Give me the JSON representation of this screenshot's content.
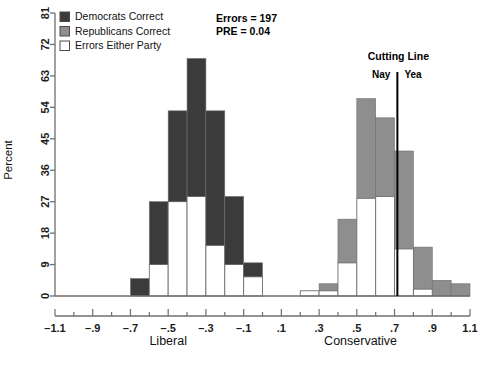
{
  "chart_data": {
    "type": "bar",
    "title": "",
    "xlabel": "",
    "ylabel": "Percent",
    "xlim": [
      -1.1,
      1.1
    ],
    "ylim": [
      0,
      81
    ],
    "grid": false,
    "legend_position": "top-left",
    "x_axis_left_label": "Liberal",
    "x_axis_right_label": "Conservative",
    "x_tick_labels": [
      "–1.1",
      "–.9",
      "–.7",
      "–.5",
      "–.3",
      "–.1",
      ".1",
      ".3",
      ".5",
      ".7",
      ".9",
      "1.1"
    ],
    "x_tick_values": [
      -1.1,
      -0.9,
      -0.7,
      -0.5,
      -0.3,
      -0.1,
      0.1,
      0.3,
      0.5,
      0.7,
      0.9,
      1.1
    ],
    "x_minor_step": 0.1,
    "y_tick_labels": [
      "0",
      "9",
      "18",
      "27",
      "36",
      "45",
      "54",
      "63",
      "72",
      "81"
    ],
    "y_tick_values": [
      0,
      9,
      18,
      27,
      36,
      45,
      54,
      63,
      72,
      81
    ],
    "bin_width": 0.1,
    "series": [
      {
        "name": "Democrats Correct",
        "color": "#3b3b3b"
      },
      {
        "name": "Republicans Correct",
        "color": "#8e8e8e"
      },
      {
        "name": "Errors Either Party",
        "color": "#ffffff"
      }
    ],
    "bars": [
      {
        "x_center": -0.65,
        "errors": 0,
        "party": 5.0,
        "party_series": "Democrats Correct"
      },
      {
        "x_center": -0.55,
        "errors": 9.0,
        "party": 18.0,
        "party_series": "Democrats Correct"
      },
      {
        "x_center": -0.45,
        "errors": 27.0,
        "party": 26.0,
        "party_series": "Democrats Correct"
      },
      {
        "x_center": -0.35,
        "errors": 28.5,
        "party": 39.5,
        "party_series": "Democrats Correct"
      },
      {
        "x_center": -0.25,
        "errors": 14.5,
        "party": 38.5,
        "party_series": "Democrats Correct"
      },
      {
        "x_center": -0.15,
        "errors": 9.0,
        "party": 19.5,
        "party_series": "Democrats Correct"
      },
      {
        "x_center": -0.05,
        "errors": 5.5,
        "party": 4.0,
        "party_series": "Democrats Correct"
      },
      {
        "x_center": 0.25,
        "errors": 1.5,
        "party": 0.0,
        "party_series": "Republicans Correct"
      },
      {
        "x_center": 0.35,
        "errors": 1.5,
        "party": 2.0,
        "party_series": "Republicans Correct"
      },
      {
        "x_center": 0.45,
        "errors": 9.5,
        "party": 12.5,
        "party_series": "Republicans Correct"
      },
      {
        "x_center": 0.55,
        "errors": 28.0,
        "party": 28.5,
        "party_series": "Republicans Correct"
      },
      {
        "x_center": 0.65,
        "errors": 28.5,
        "party": 22.5,
        "party_series": "Republicans Correct"
      },
      {
        "x_center": 0.75,
        "errors": 13.5,
        "party": 28.0,
        "party_series": "Republicans Correct"
      },
      {
        "x_center": 0.85,
        "errors": 2.0,
        "party": 12.0,
        "party_series": "Republicans Correct"
      },
      {
        "x_center": 0.95,
        "errors": 0.0,
        "party": 4.5,
        "party_series": "Republicans Correct"
      },
      {
        "x_center": 1.05,
        "errors": 0.0,
        "party": 3.5,
        "party_series": "Republicans Correct"
      }
    ],
    "cutting_line": {
      "x": 0.715,
      "label": "Cutting Line",
      "left_label": "Nay",
      "right_label": "Yea"
    },
    "annotations": {
      "errors": "Errors = 197",
      "pre": "PRE = 0.04"
    }
  },
  "colors": {
    "democrat": "#3b3b3b",
    "republican": "#8e8e8e",
    "errors": "#ffffff",
    "axis": "#6f6f6f",
    "bar_outline": "#6f6f6f",
    "cut_line": "#000000",
    "background": "#ffffff"
  }
}
